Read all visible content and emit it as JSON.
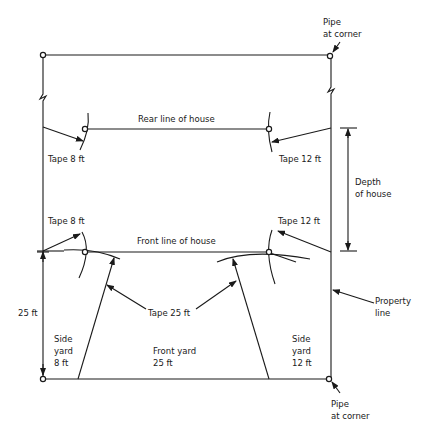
{
  "diagram": {
    "labels": {
      "pipe_top": [
        "Pipe",
        "at corner"
      ],
      "pipe_bottom": [
        "Pipe",
        "at corner"
      ],
      "rear_line": "Rear line of house",
      "front_line": "Front line of house",
      "tape_8_rear": "Tape 8 ft",
      "tape_12_rear": "Tape 12 ft",
      "tape_8_front": "Tape 8 ft",
      "tape_12_front": "Tape 12 ft",
      "tape_25": "Tape 25 ft",
      "depth": [
        "Depth",
        "of house"
      ],
      "setback": "25 ft",
      "property_line": [
        "Property",
        "line"
      ],
      "side_yard_left": [
        "Side",
        "yard",
        "8 ft"
      ],
      "front_yard": [
        "Front yard",
        "25 ft"
      ],
      "side_yard_right": [
        "Side",
        "yard",
        "12 ft"
      ]
    },
    "colors": {
      "line": "#1a1a1a",
      "background": "#ffffff"
    }
  }
}
